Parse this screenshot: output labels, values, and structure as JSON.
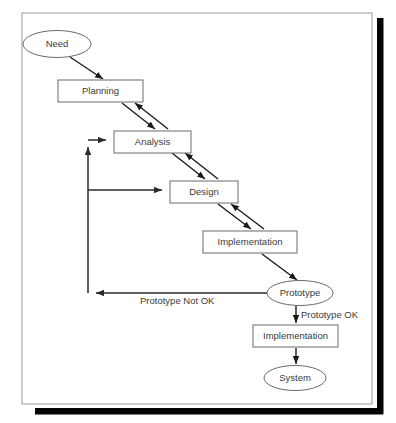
{
  "diagram": {
    "colors": {
      "node_stroke": "#6b6b6b",
      "node_fill": "#ffffff",
      "line": "#1a1a1a",
      "text": "#3a3a3a",
      "frame_stroke": "#9a9a9a",
      "shadow": "#050505"
    },
    "nodes": {
      "need": "Need",
      "planning": "Planning",
      "analysis": "Analysis",
      "design": "Design",
      "implementation": "Implementation",
      "prototype": "Prototype",
      "implementation_final": "Implementation",
      "system": "System"
    },
    "edge_labels": {
      "prototype_not_ok": "Prototype Not OK",
      "prototype_ok": "Prototype OK"
    }
  }
}
